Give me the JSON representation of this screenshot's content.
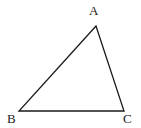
{
  "figure": {
    "kind": "geometry-diagram",
    "shape_name": "triangle",
    "background_color": "#ffffff",
    "stroke_color": "#1a1a1a",
    "stroke_width": 1.3,
    "canvas": {
      "width": 141,
      "height": 128
    },
    "vertices": [
      {
        "id": "A",
        "label": "A",
        "x": 96,
        "y": 26,
        "label_x": 89,
        "label_y": 4
      },
      {
        "id": "B",
        "label": "B",
        "x": 19,
        "y": 111,
        "label_x": 7,
        "label_y": 112
      },
      {
        "id": "C",
        "label": "C",
        "x": 124,
        "y": 111,
        "label_x": 123,
        "label_y": 112
      }
    ],
    "edges": [
      {
        "id": "AB",
        "from": "A",
        "to": "B"
      },
      {
        "id": "BC",
        "from": "B",
        "to": "C"
      },
      {
        "id": "CA",
        "from": "C",
        "to": "A"
      }
    ],
    "path_points": "96,26 19,111 124,111"
  }
}
